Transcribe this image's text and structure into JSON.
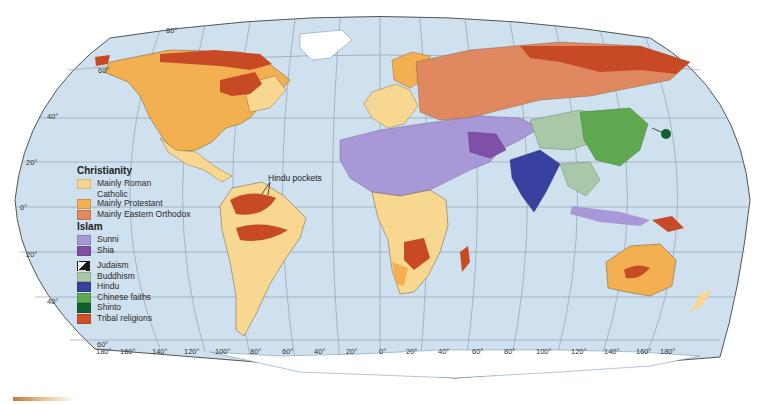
{
  "map": {
    "title": "World religions",
    "projection": "Robinson",
    "ocean_color": "#cfe0ee",
    "latitude_labels": [
      "80°",
      "60°",
      "40°",
      "20°",
      "0°",
      "20°",
      "40°",
      "60°"
    ],
    "longitude_labels": [
      "180°",
      "160°",
      "140°",
      "120°",
      "100°",
      "80°",
      "60°",
      "40°",
      "20°",
      "0°",
      "20°",
      "40°",
      "60°",
      "80°",
      "100°",
      "120°",
      "140°",
      "160°",
      "180°"
    ],
    "annotation": "Hindu pockets"
  },
  "legend": {
    "christianity": {
      "heading": "Christianity",
      "items": [
        {
          "label_line1": "Mainly Roman",
          "label_line2": "Catholic",
          "color": "#f8d890"
        },
        {
          "label": "Mainly Protestant",
          "color": "#f2b050"
        },
        {
          "label": "Mainly Eastern Orthodox",
          "color": "#e08860"
        }
      ]
    },
    "islam": {
      "heading": "Islam",
      "items": [
        {
          "label": "Sunni",
          "color": "#a898d8"
        },
        {
          "label": "Shia",
          "color": "#8050a8"
        }
      ]
    },
    "other": [
      {
        "label": "Judaism",
        "color": "#1a1a1a"
      },
      {
        "label": "Buddhism",
        "color": "#a8c8a8"
      },
      {
        "label": "Hindu",
        "color": "#3840a0"
      },
      {
        "label": "Chinese faiths",
        "color": "#60a850"
      },
      {
        "label": "Shinto",
        "color": "#106030"
      },
      {
        "label": "Tribal religions",
        "color": "#d05028"
      }
    ]
  }
}
